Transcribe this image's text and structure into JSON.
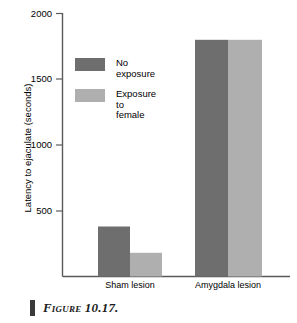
{
  "figure": {
    "caption": "Figure 10.17.",
    "caption_marker": "caption-bar"
  },
  "chart_data": {
    "type": "bar",
    "title": "",
    "xlabel": "",
    "ylabel": "Latency to ejaculate (seconds)",
    "categories": [
      "Sham lesion",
      "Amygdala lesion"
    ],
    "series": [
      {
        "name": "No exposure",
        "color": "#6e6e6e",
        "values": [
          380,
          1800
        ]
      },
      {
        "name": "Exposure to\nfemale",
        "color": "#afafaf",
        "values": [
          180,
          1800
        ]
      }
    ],
    "ylim": [
      0,
      2000
    ],
    "yticks": [
      500,
      1000,
      1500,
      2000
    ],
    "ytick_labels": [
      "500",
      "1000",
      "1500",
      "2000"
    ],
    "grid": false,
    "legend_position": "inside-upper-left"
  },
  "axis": {
    "tick_2000": "2000",
    "tick_1500": "1500",
    "tick_1000": "1000",
    "tick_500": "500"
  },
  "categories": {
    "sham": "Sham lesion",
    "amygdala": "Amygdala lesion"
  },
  "legend": {
    "entry_0": "No exposure",
    "entry_1": "Exposure to\nfemale"
  },
  "colors": {
    "no_exposure": "#6e6e6e",
    "exposure_to_female": "#afafaf",
    "axis": "#5a5a5a",
    "text": "#000000"
  }
}
